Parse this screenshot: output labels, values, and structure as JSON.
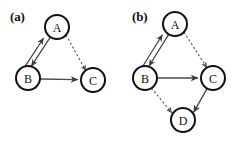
{
  "figure": {
    "background_color": "#ffffff",
    "node_fill": "#ffffff",
    "node_stroke": "#111111",
    "solid_edge_color": "#4a4a4a",
    "dashed_edge_color": "#555555",
    "width": 246,
    "height": 142
  },
  "panels": [
    {
      "id": "a",
      "label": "(a)",
      "nodes": [
        {
          "id": "A",
          "label": "A",
          "cx": 57,
          "cy": 27,
          "r": 12
        },
        {
          "id": "B",
          "label": "B",
          "cx": 28,
          "cy": 78,
          "r": 12
        },
        {
          "id": "C",
          "label": "C",
          "cx": 93,
          "cy": 80,
          "r": 12
        }
      ],
      "edges": [
        {
          "from": "A",
          "to": "B",
          "style": "double",
          "direction": "bidirectional"
        },
        {
          "from": "A",
          "to": "C",
          "style": "dashed",
          "direction": "directed"
        },
        {
          "from": "B",
          "to": "C",
          "style": "solid",
          "direction": "directed"
        }
      ]
    },
    {
      "id": "b",
      "label": "(b)",
      "nodes": [
        {
          "id": "A",
          "label": "A",
          "cx": 52,
          "cy": 24,
          "r": 12
        },
        {
          "id": "B",
          "label": "B",
          "cx": 22,
          "cy": 78,
          "r": 12
        },
        {
          "id": "C",
          "label": "C",
          "cx": 90,
          "cy": 78,
          "r": 12
        },
        {
          "id": "D",
          "label": "D",
          "cx": 60,
          "cy": 120,
          "r": 12
        }
      ],
      "edges": [
        {
          "from": "A",
          "to": "B",
          "style": "double",
          "direction": "bidirectional"
        },
        {
          "from": "A",
          "to": "C",
          "style": "dashed",
          "direction": "directed"
        },
        {
          "from": "B",
          "to": "C",
          "style": "solid",
          "direction": "directed"
        },
        {
          "from": "B",
          "to": "D",
          "style": "dashed",
          "direction": "directed"
        },
        {
          "from": "C",
          "to": "D",
          "style": "solid",
          "direction": "directed"
        }
      ]
    }
  ]
}
